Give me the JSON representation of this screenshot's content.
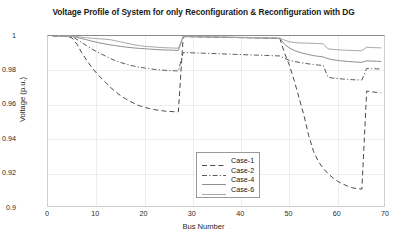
{
  "chart_data": {
    "type": "line",
    "title": "Voltage Profile of System for only Reconfiguration & Reconfiguration with DG",
    "xlabel": "Bus Number",
    "ylabel": "Voltage (p.u.)",
    "xlim": [
      0,
      70
    ],
    "ylim": [
      0.9,
      1.0
    ],
    "xticks": [
      0,
      10,
      20,
      30,
      40,
      50,
      60,
      70
    ],
    "yticks": [
      0.9,
      0.92,
      0.94,
      0.96,
      0.98,
      1
    ],
    "ytick_labels": [
      "0.9",
      "0.92",
      "0.94",
      "0.96",
      "0.98",
      "1"
    ],
    "xtick_labels": [
      "0",
      "10",
      "20",
      "30",
      "40",
      "50",
      "60",
      "70"
    ],
    "grid": true,
    "legend_position": "lower-center",
    "series": [
      {
        "name": "Case-1",
        "style": "dashed",
        "color": "#4a4a4a",
        "x": [
          1,
          2,
          3,
          4,
          5,
          6,
          7,
          8,
          9,
          10,
          11,
          12,
          13,
          14,
          15,
          16,
          17,
          18,
          19,
          20,
          21,
          22,
          23,
          24,
          25,
          26,
          27,
          28,
          29,
          30,
          31,
          32,
          33,
          34,
          35,
          36,
          37,
          38,
          39,
          40,
          41,
          42,
          43,
          44,
          45,
          46,
          47,
          48,
          49,
          50,
          51,
          52,
          53,
          54,
          55,
          56,
          57,
          58,
          59,
          60,
          61,
          62,
          63,
          64,
          65,
          66,
          67,
          68,
          69
        ],
        "y": [
          1.0,
          1.0,
          1.0,
          0.9998,
          0.9988,
          0.9952,
          0.9902,
          0.986,
          0.982,
          0.9786,
          0.9756,
          0.9728,
          0.97,
          0.9676,
          0.9654,
          0.9636,
          0.962,
          0.9606,
          0.9594,
          0.9586,
          0.9578,
          0.9572,
          0.9568,
          0.9564,
          0.9562,
          0.956,
          0.9559,
          0.9996,
          0.9996,
          0.9996,
          0.9995,
          0.9995,
          0.9994,
          0.9994,
          0.9993,
          0.9993,
          0.9992,
          0.9992,
          0.9991,
          0.9991,
          0.999,
          0.999,
          0.9989,
          0.9989,
          0.9988,
          0.9988,
          0.9987,
          0.9986,
          0.99,
          0.983,
          0.974,
          0.964,
          0.954,
          0.942,
          0.933,
          0.927,
          0.923,
          0.92,
          0.9175,
          0.9155,
          0.914,
          0.9128,
          0.9118,
          0.9112,
          0.911,
          0.968,
          0.9676,
          0.9672,
          0.967
        ]
      },
      {
        "name": "Case-2",
        "style": "dash-dot",
        "color": "#5a5a5a",
        "x": [
          1,
          2,
          3,
          4,
          5,
          6,
          7,
          8,
          9,
          10,
          11,
          12,
          13,
          14,
          15,
          16,
          17,
          18,
          19,
          20,
          21,
          22,
          23,
          24,
          25,
          26,
          27,
          28,
          29,
          30,
          31,
          32,
          33,
          34,
          35,
          36,
          37,
          38,
          39,
          40,
          41,
          42,
          43,
          44,
          45,
          46,
          47,
          48,
          49,
          50,
          51,
          52,
          53,
          54,
          55,
          56,
          57,
          58,
          59,
          60,
          61,
          62,
          63,
          64,
          65,
          66,
          67,
          68,
          69
        ],
        "y": [
          1.0,
          1.0,
          1.0,
          0.9999,
          0.9995,
          0.998,
          0.9962,
          0.9944,
          0.9926,
          0.991,
          0.9896,
          0.9882,
          0.9868,
          0.9856,
          0.9846,
          0.9838,
          0.983,
          0.9824,
          0.9818,
          0.9814,
          0.981,
          0.9806,
          0.9803,
          0.9801,
          0.9799,
          0.9798,
          0.9797,
          0.9904,
          0.9903,
          0.9902,
          0.9901,
          0.99,
          0.9899,
          0.9898,
          0.9897,
          0.9896,
          0.9895,
          0.9894,
          0.9893,
          0.9892,
          0.9891,
          0.989,
          0.9889,
          0.9888,
          0.9887,
          0.9886,
          0.9885,
          0.9884,
          0.987,
          0.9858,
          0.9852,
          0.9847,
          0.9842,
          0.9838,
          0.9834,
          0.9831,
          0.9828,
          0.976,
          0.9755,
          0.9752,
          0.975,
          0.9748,
          0.9746,
          0.9745,
          0.9744,
          0.9812,
          0.981,
          0.9809,
          0.9808
        ]
      },
      {
        "name": "Case-4",
        "style": "solid",
        "color": "#8e8e8e",
        "x": [
          1,
          2,
          3,
          4,
          5,
          6,
          7,
          8,
          9,
          10,
          11,
          12,
          13,
          14,
          15,
          16,
          17,
          18,
          19,
          20,
          21,
          22,
          23,
          24,
          25,
          26,
          27,
          28,
          29,
          30,
          31,
          32,
          33,
          34,
          35,
          36,
          37,
          38,
          39,
          40,
          41,
          42,
          43,
          44,
          45,
          46,
          47,
          48,
          49,
          50,
          51,
          52,
          53,
          54,
          55,
          56,
          57,
          58,
          59,
          60,
          61,
          62,
          63,
          64,
          65,
          66,
          67,
          68,
          69
        ],
        "y": [
          1.0,
          1.0,
          1.0,
          1.0,
          0.9998,
          0.9992,
          0.9985,
          0.9978,
          0.9971,
          0.9964,
          0.9958,
          0.9953,
          0.9948,
          0.9944,
          0.994,
          0.9936,
          0.9933,
          0.993,
          0.9928,
          0.9926,
          0.9924,
          0.9922,
          0.992,
          0.9919,
          0.9918,
          0.9917,
          0.9916,
          0.9996,
          0.9996,
          0.9995,
          0.9995,
          0.9994,
          0.9994,
          0.9993,
          0.9993,
          0.9992,
          0.9992,
          0.9991,
          0.9991,
          0.999,
          0.999,
          0.9989,
          0.9989,
          0.9988,
          0.9988,
          0.9987,
          0.9987,
          0.9986,
          0.9952,
          0.993,
          0.9916,
          0.9906,
          0.9898,
          0.9892,
          0.9886,
          0.9882,
          0.9878,
          0.9868,
          0.9862,
          0.9858,
          0.9855,
          0.9852,
          0.985,
          0.9848,
          0.9847,
          0.9856,
          0.9854,
          0.9853,
          0.9852
        ]
      },
      {
        "name": "Case-6",
        "style": "solid",
        "color": "#a8a8a8",
        "x": [
          1,
          2,
          3,
          4,
          5,
          6,
          7,
          8,
          9,
          10,
          11,
          12,
          13,
          14,
          15,
          16,
          17,
          18,
          19,
          20,
          21,
          22,
          23,
          24,
          25,
          26,
          27,
          28,
          29,
          30,
          31,
          32,
          33,
          34,
          35,
          36,
          37,
          38,
          39,
          40,
          41,
          42,
          43,
          44,
          45,
          46,
          47,
          48,
          49,
          50,
          51,
          52,
          53,
          54,
          55,
          56,
          57,
          58,
          59,
          60,
          61,
          62,
          63,
          64,
          65,
          66,
          67,
          68,
          69
        ],
        "y": [
          1.0,
          1.0,
          1.0,
          1.0,
          0.9999,
          0.9996,
          0.9993,
          0.999,
          0.9987,
          0.9985,
          0.9983,
          0.9981,
          0.9978,
          0.9972,
          0.9966,
          0.996,
          0.9954,
          0.9948,
          0.9944,
          0.994,
          0.9938,
          0.9936,
          0.9934,
          0.9932,
          0.9931,
          0.993,
          0.9929,
          0.9998,
          0.9998,
          0.9997,
          0.9997,
          0.9996,
          0.9996,
          0.9995,
          0.9995,
          0.9994,
          0.9994,
          0.9993,
          0.9993,
          0.9992,
          0.9992,
          0.9991,
          0.9991,
          0.999,
          0.999,
          0.9989,
          0.9989,
          0.9988,
          0.9976,
          0.9966,
          0.9962,
          0.996,
          0.9959,
          0.9958,
          0.9957,
          0.9956,
          0.9955,
          0.9925,
          0.9922,
          0.992,
          0.9918,
          0.9917,
          0.9916,
          0.9915,
          0.9914,
          0.9935,
          0.9933,
          0.9932,
          0.9931
        ]
      }
    ]
  }
}
